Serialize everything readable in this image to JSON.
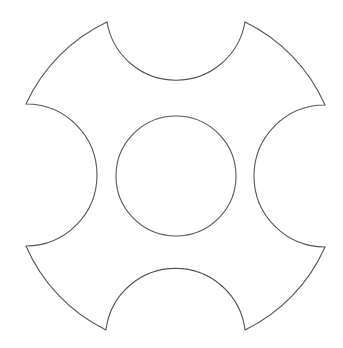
{
  "diagram": {
    "type": "geometric-shape",
    "colors": {
      "background": "#ffffff",
      "stroke": "#555555",
      "fill": "#ffffff"
    },
    "outer_shape": {
      "center": [
        176,
        176
      ],
      "radius": 167,
      "notch_count": 4,
      "notch_radius": 70,
      "vertices": [
        [
          107,
          22
        ],
        [
          245,
          22
        ],
        [
          325,
          105
        ],
        [
          325,
          247
        ],
        [
          245,
          330
        ],
        [
          106,
          330
        ],
        [
          26,
          246
        ],
        [
          26,
          104
        ]
      ]
    },
    "center_hole": {
      "center": [
        176,
        176
      ],
      "radius": 60
    }
  }
}
